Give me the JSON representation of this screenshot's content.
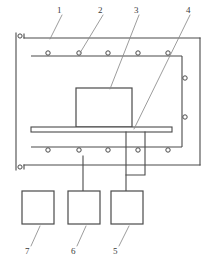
{
  "figure": {
    "type": "patent-line-drawing",
    "background_color": "#ffffff",
    "stroke_color": "#4a4a4a",
    "leader_stroke_color": "#8a8a8a",
    "label_color": "#3a3a3a",
    "width": 207,
    "height": 263
  },
  "reference_numerals": [
    {
      "id": "1",
      "text": "1",
      "x": 60,
      "y": 8,
      "points_to": "outer-frame-top-rail"
    },
    {
      "id": "2",
      "text": "2",
      "x": 101,
      "y": 8,
      "points_to": "upper-rail-roller"
    },
    {
      "id": "3",
      "text": "3",
      "x": 137,
      "y": 8,
      "points_to": "center-block"
    },
    {
      "id": "4",
      "text": "4",
      "x": 188,
      "y": 8,
      "points_to": "horizontal-plate"
    },
    {
      "id": "5",
      "text": "5",
      "x": 115,
      "y": 251,
      "points_to": "bottom-box-5"
    },
    {
      "id": "6",
      "text": "6",
      "x": 73,
      "y": 251,
      "points_to": "bottom-box-6"
    },
    {
      "id": "7",
      "text": "7",
      "x": 27,
      "y": 251,
      "points_to": "bottom-box-7"
    }
  ],
  "components": {
    "outer_frame": {
      "name": "outer-frame",
      "left_rail_x": 16,
      "top_y": 38,
      "bottom_y": 165,
      "right_x": 200
    },
    "upper_rail": {
      "name": "upper-rail",
      "y": 55,
      "x_start": 31,
      "x_end": 182,
      "roller_count": 5,
      "roller_positions_x": [
        48,
        79,
        108,
        138,
        168
      ]
    },
    "lower_rail": {
      "name": "lower-rail",
      "y": 147,
      "x_start": 31,
      "x_end": 182,
      "roller_count": 5,
      "roller_positions_x": [
        48,
        79,
        108,
        138,
        168
      ]
    },
    "right_rail": {
      "name": "right-rail",
      "x": 182,
      "y_start": 55,
      "y_end": 147,
      "roller_count": 2,
      "roller_positions_y": [
        78,
        117
      ]
    },
    "left_rail_terminals": {
      "name": "left-rail-terminals",
      "x": 19,
      "positions_y": [
        38,
        165
      ]
    },
    "center_block": {
      "name": "center-block",
      "x": 76,
      "y": 88,
      "width": 56,
      "height": 38
    },
    "horizontal_plate": {
      "name": "horizontal-plate",
      "x": 31,
      "y": 127,
      "width": 141,
      "height": 5
    },
    "bottom_boxes": [
      {
        "name": "bottom-box-7",
        "label": "7",
        "x": 22,
        "y": 191,
        "width": 31,
        "height": 33,
        "connected": false
      },
      {
        "name": "bottom-box-6",
        "label": "6",
        "x": 68,
        "y": 191,
        "width": 31,
        "height": 33,
        "connected": true
      },
      {
        "name": "bottom-box-5",
        "label": "5",
        "x": 111,
        "y": 191,
        "width": 31,
        "height": 33,
        "connected": true
      }
    ],
    "connectors": [
      {
        "name": "connector-plate-to-box-6",
        "from": "lower-rail",
        "to": "bottom-box-6"
      },
      {
        "name": "connector-plate-to-box-5",
        "from": "horizontal-plate",
        "to": "bottom-box-5"
      },
      {
        "name": "connector-right-drop",
        "from": "horizontal-plate-right",
        "to": "bottom-box-5"
      }
    ]
  }
}
